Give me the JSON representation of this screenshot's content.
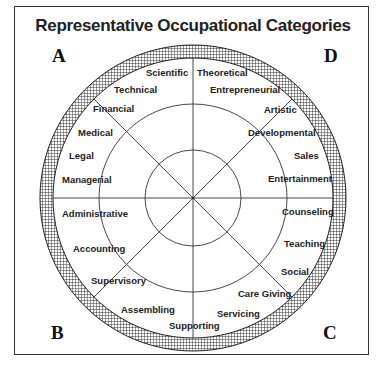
{
  "title": "Representative Occupational Categories",
  "colors": {
    "line": "#333333",
    "text": "#222222",
    "background": "#ffffff"
  },
  "corners": {
    "top_left": "A",
    "top_right": "D",
    "bottom_left": "B",
    "bottom_right": "C"
  },
  "quadrants": {
    "A": [
      "Scientific",
      "Technical",
      "Financial",
      "Medical",
      "Legal",
      "Managerial"
    ],
    "D": [
      "Theoretical",
      "Entrepreneurial",
      "Artistic",
      "Developmental",
      "Sales",
      "Entertainment"
    ],
    "B": [
      "Administrative",
      "Accounting",
      "Supervisory",
      "Assembling",
      "Supporting"
    ],
    "C": [
      "Counseling",
      "Teaching",
      "Social",
      "Care Giving",
      "Servicing"
    ]
  },
  "labels": {
    "scientific": "Scientific",
    "technical": "Technical",
    "financial": "Financial",
    "medical": "Medical",
    "legal": "Legal",
    "managerial": "Managerial",
    "theoretical": "Theoretical",
    "entrepreneurial": "Entrepreneurial",
    "artistic": "Artistic",
    "developmental": "Developmental",
    "sales": "Sales",
    "entertainment": "Entertainment",
    "administrative": "Administrative",
    "accounting": "Accounting",
    "supervisory": "Supervisory",
    "assembling": "Assembling",
    "supporting": "Supporting",
    "counseling": "Counseling",
    "teaching": "Teaching",
    "social": "Social",
    "care_giving": "Care Giving",
    "servicing": "Servicing"
  }
}
